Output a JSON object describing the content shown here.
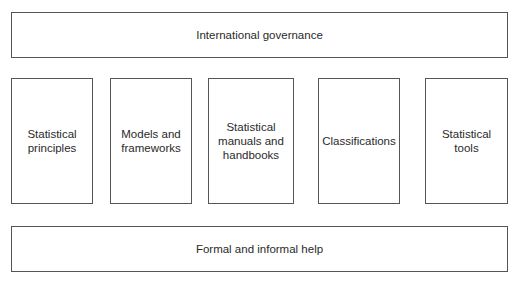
{
  "diagram": {
    "top": {
      "label": "International governance"
    },
    "columns": [
      {
        "label": "Statistical\nprinciples"
      },
      {
        "label": "Models and\nframeworks"
      },
      {
        "label": "Statistical\nmanuals and\nhandbooks"
      },
      {
        "label": "Classifications"
      },
      {
        "label": "Statistical\ntools"
      }
    ],
    "bottom": {
      "label": "Formal and informal help"
    }
  }
}
